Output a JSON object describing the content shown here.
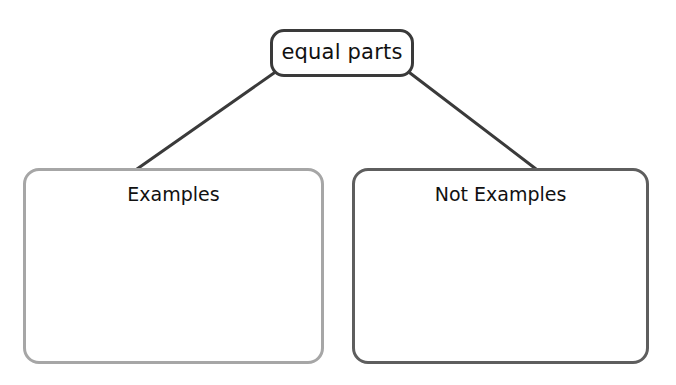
{
  "diagram": {
    "type": "concept-map",
    "root": {
      "label": "equal parts",
      "border_color": "#3a3a3a"
    },
    "children": [
      {
        "label": "Examples",
        "border_color": "#a6a6a6",
        "content": ""
      },
      {
        "label": "Not Examples",
        "border_color": "#5e5e5e",
        "content": ""
      }
    ],
    "connector_color": "#3a3a3a"
  }
}
